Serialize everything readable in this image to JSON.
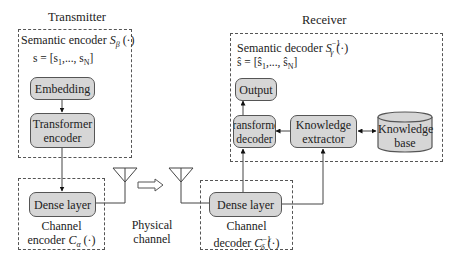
{
  "transmitter": {
    "title": "Transmitter",
    "semantic_encoder": {
      "label_prefix": "Semantic encoder ",
      "symbol": "S",
      "subscript": "β",
      "arg": " (·)",
      "vector_eq": "s = [s",
      "vector_first_sub": "1",
      "vector_mid": ",..., s",
      "vector_last_sub": "N",
      "vector_close": "]",
      "blocks": {
        "embedding": "Embedding",
        "transformer_encoder_line1": "Transformer",
        "transformer_encoder_line2": "encoder"
      }
    },
    "channel_encoder": {
      "dense_layer": "Dense layer",
      "label_line1": "Channel",
      "label_line2_prefix": "encoder ",
      "symbol": "C",
      "subscript": "α",
      "arg": " (·)"
    }
  },
  "channel": {
    "label_line1": "Physical",
    "label_line2": "channel"
  },
  "receiver": {
    "title": "Receiver",
    "semantic_decoder": {
      "label_prefix": "Semantic decoder ",
      "symbol": "S",
      "subscript": "γ",
      "superscript": "−1",
      "arg": " (·)",
      "vector_eq": "ŝ = [ŝ",
      "vector_first_sub": "1",
      "vector_mid": ",..., ŝ",
      "vector_last_sub": "N",
      "vector_close": "]",
      "blocks": {
        "output": "Output",
        "transformer_decoder_line1": "Transformer",
        "transformer_decoder_line2": "decoder",
        "knowledge_extractor_line1": "Knowledge",
        "knowledge_extractor_line2": "extractor",
        "knowledge_base_line1": "Knowledge",
        "knowledge_base_line2": "base"
      }
    },
    "channel_decoder": {
      "dense_layer": "Dense layer",
      "label_line1": "Channel",
      "label_line2_prefix": "decoder ",
      "symbol": "C",
      "subscript": "δ",
      "superscript": "−1",
      "arg": " (·)"
    }
  },
  "colors": {
    "block_fill": "#d6d6d6",
    "stroke": "#555555",
    "background": "#ffffff"
  }
}
